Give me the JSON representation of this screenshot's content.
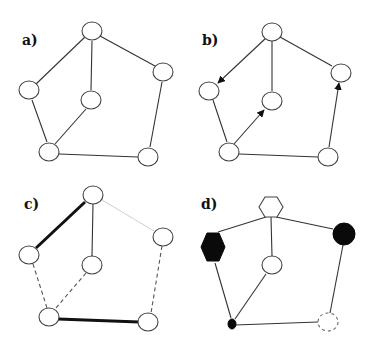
{
  "panels": [
    {
      "id": "a",
      "label": "a)"
    },
    {
      "id": "b",
      "label": "b)"
    },
    {
      "id": "c",
      "label": "c)"
    },
    {
      "id": "d",
      "label": "d)"
    }
  ],
  "graph": {
    "nodes": [
      "top",
      "left",
      "middle",
      "right",
      "bottom-left",
      "bottom-right"
    ],
    "edges": [
      [
        "top",
        "left"
      ],
      [
        "top",
        "middle"
      ],
      [
        "top",
        "right"
      ],
      [
        "left",
        "bottom-left"
      ],
      [
        "middle",
        "bottom-left"
      ],
      [
        "bottom-left",
        "bottom-right"
      ],
      [
        "right",
        "bottom-right"
      ]
    ]
  },
  "panel_b": {
    "directed_edges": [
      [
        "top",
        "left"
      ],
      [
        "bottom-left",
        "middle"
      ],
      [
        "bottom-right",
        "right"
      ]
    ]
  },
  "panel_c": {
    "bold_edges": [
      [
        "top",
        "left"
      ],
      [
        "bottom-left",
        "bottom-right"
      ]
    ],
    "dashed_edges": [
      [
        "left",
        "bottom-left"
      ],
      [
        "middle",
        "bottom-left"
      ],
      [
        "right",
        "bottom-right"
      ]
    ],
    "faint_edges": [
      [
        "top",
        "right"
      ]
    ],
    "solid_edges": [
      [
        "top",
        "middle"
      ]
    ]
  },
  "panel_d": {
    "node_styles": {
      "top": "white-hexagon",
      "left": "black-hexagon",
      "middle": "white-circle",
      "right": "black-circle",
      "bottom-left": "small-black-ellipse",
      "bottom-right": "dashed-circle"
    }
  }
}
